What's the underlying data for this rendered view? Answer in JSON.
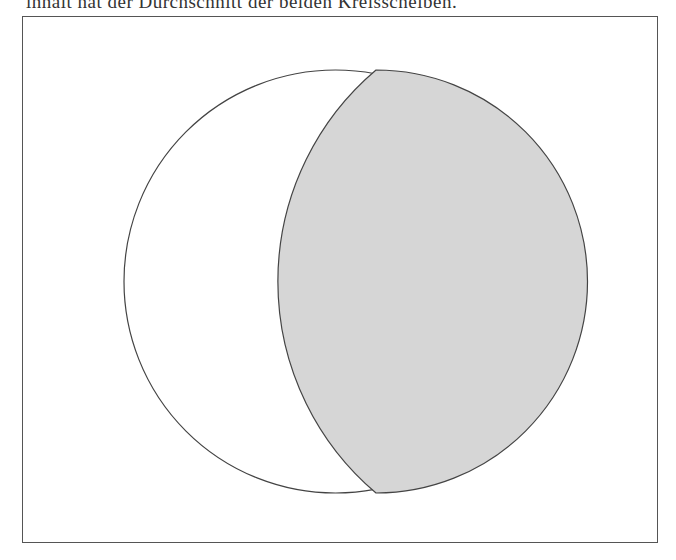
{
  "caption": {
    "text": "innält hat der Durchschnitt der beiden Kreisscheiben."
  },
  "figure": {
    "main_circle": {
      "cx": 335.5,
      "cy": 281.5,
      "r": 211.5,
      "stroke": "#444444",
      "fill": "#ffffff"
    },
    "lens": {
      "top_point": [
        376,
        70
      ],
      "bottom_point": [
        376,
        493
      ],
      "inner_arc_radius": 277,
      "outer_arc_radius": 211.5,
      "fill": "#d6d6d6",
      "stroke": "#444444"
    }
  }
}
